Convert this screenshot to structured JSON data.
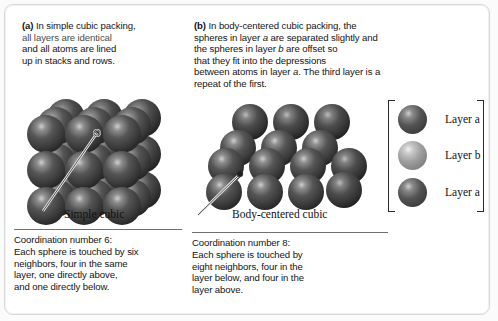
{
  "figure": {
    "background": "#ffffff",
    "border_color": "#d8d8d8"
  },
  "panel_a": {
    "label": "(a)",
    "text_line_1": " In simple cubic packing,",
    "text_line_2": "all layers are identical",
    "text_line_3": "and all atoms are lined",
    "text_line_4": "up in stacks and rows.",
    "structure_label": "Simple cubic",
    "coordination": {
      "line_1": "Coordination number 6:",
      "line_2": "Each sphere is touched by six",
      "line_3": "neighbors, four in the same",
      "line_4": "layer, one directly above,",
      "line_5": "and one directly below."
    }
  },
  "panel_b": {
    "label": "(b)",
    "text_line_1": " In body-centered cubic packing, the",
    "text_line_2_pre": "spheres in layer ",
    "text_line_2_ital": "a",
    "text_line_2_post": " are separated slightly and",
    "text_line_3_pre": "the spheres in layer ",
    "text_line_3_ital": "b",
    "text_line_3_post": " are offset so",
    "text_line_4": "that they fit into the depressions",
    "text_line_5_pre": "between atoms in layer ",
    "text_line_5_ital": "a",
    "text_line_5_post": ". The third layer is a",
    "text_line_6": "repeat of the first.",
    "structure_label": "Body-centered cubic",
    "coordination": {
      "line_1": "Coordination number 8:",
      "line_2": "Each sphere is touched by",
      "line_3": "eight neighbors, four in the",
      "line_4": "layer below, and four in the",
      "line_5": "layer above."
    }
  },
  "legend": {
    "rows": [
      {
        "label": "Layer a",
        "color": "#4a4a4a",
        "highlight": "#b9b9b9"
      },
      {
        "label": "Layer b",
        "color": "#8d8d8d",
        "highlight": "#d8d8d8"
      },
      {
        "label": "Layer a",
        "color": "#4a4a4a",
        "highlight": "#b9b9b9"
      }
    ]
  },
  "spheres": {
    "atom_color": "#3f3f3f",
    "atom_color_light": "#545454",
    "atom_shadow": "#1d1d1d",
    "highlight_color": "#c9c9c9",
    "simple_cubic": {
      "rows": 3,
      "cols": 3,
      "layers": 3,
      "description": "3x3x3 simple cubic array, spheres aligned in stacks and rows"
    },
    "body_centered_cubic": {
      "rows": 3,
      "cols": 3,
      "layers": 3,
      "description": "body-centered cubic array with layer b offset into depressions of layer a"
    }
  }
}
